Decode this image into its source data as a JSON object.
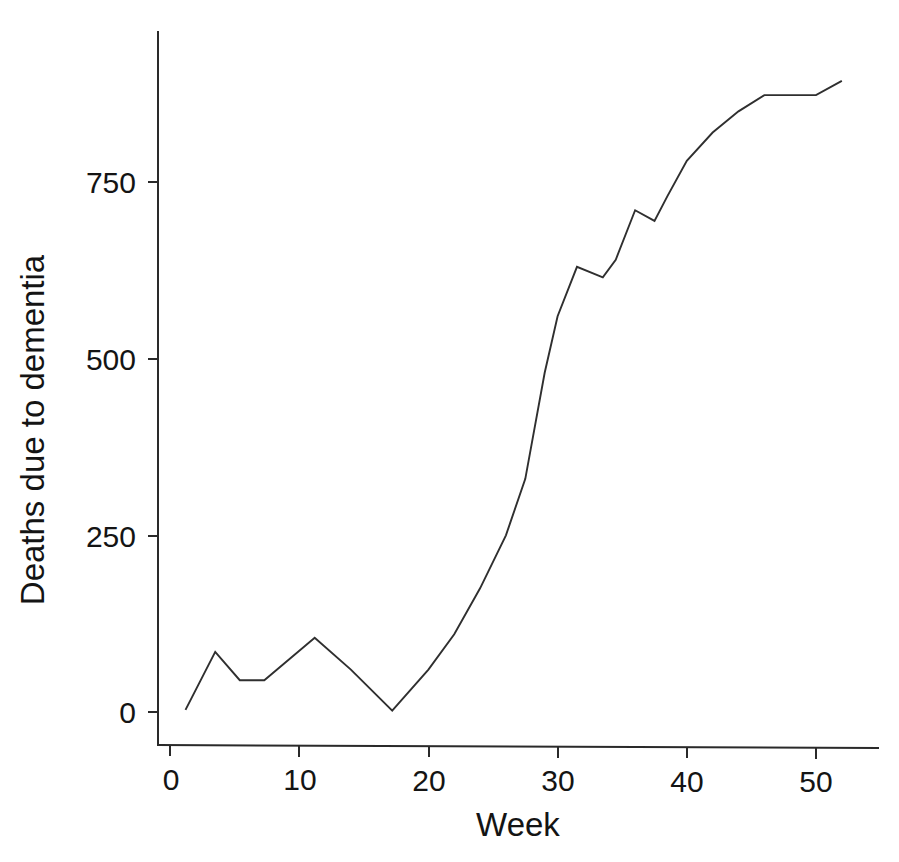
{
  "chart_data": {
    "type": "line",
    "title": "",
    "subtitle": "",
    "xlabel": "Week",
    "ylabel": "Deaths due to dementia",
    "xlim": [
      0,
      54
    ],
    "ylim": [
      -15,
      920
    ],
    "grid": false,
    "legend": null,
    "xticks": [
      "0",
      "10",
      "20",
      "30",
      "40",
      "50"
    ],
    "xtick_values": [
      0,
      10,
      20,
      30,
      40,
      50
    ],
    "yticks": [
      "0",
      "250",
      "500",
      "750"
    ],
    "ytick_values": [
      0,
      250,
      500,
      750
    ],
    "line_color": "#2f2f2f",
    "series": [
      {
        "name": "Deaths due to dementia",
        "x": [
          1.2,
          3.5,
          5.4,
          7.3,
          11.2,
          14.0,
          17.2,
          20.0,
          22.0,
          24.0,
          26.0,
          27.5,
          29.0,
          30.0,
          31.5,
          33.5,
          34.5,
          36.0,
          37.5,
          38.5,
          40.0,
          42.0,
          44.0,
          46.0,
          48.0,
          50.0,
          52.0
        ],
        "y": [
          3,
          85,
          45,
          45,
          105,
          60,
          2,
          60,
          110,
          175,
          250,
          330,
          480,
          560,
          630,
          615,
          640,
          710,
          695,
          730,
          780,
          820,
          850,
          873,
          873,
          873,
          893
        ]
      }
    ]
  },
  "axes": {
    "x_axis_label": "Week",
    "y_axis_label": "Deaths due to dementia"
  }
}
